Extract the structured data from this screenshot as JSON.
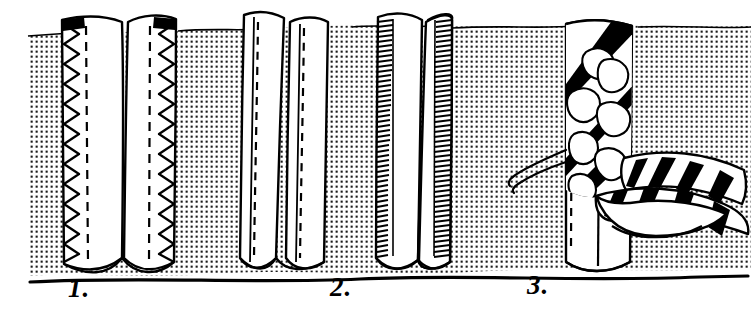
{
  "figure": {
    "medium": "pen-and-ink line drawing with halftone dot shading",
    "width": 751,
    "height": 311,
    "background_color": "#ffffff",
    "ink_color": "#000000",
    "fabric_tone": "#d9d9d9"
  },
  "labels": [
    {
      "id": "1",
      "text": "1.",
      "x": 68,
      "y": 275
    },
    {
      "id": "2",
      "text": "2.",
      "x": 330,
      "y": 274
    },
    {
      "id": "3",
      "text": "3.",
      "x": 527,
      "y": 272
    }
  ],
  "panels": [
    {
      "number": "1.",
      "name": "zigzag-overcast-finish",
      "caption": "Zigzag / overcast stitched raw edges",
      "stitch_type": "zigzag",
      "stitch_detail": "Open zigzag overcasting worked over each raw edge, with a dashed machine seam line stitched just inside the edge.",
      "seam_allowances": 2,
      "x_range": [
        60,
        178
      ]
    },
    {
      "number": "2.",
      "name": "turned-and-stitched-and-dense-overcast",
      "caption": "Turned-and-stitched edges and closely overcast edges",
      "stitch_type": "running-stitch-and-dense-overcast",
      "stitch_detail": "Left pair: raw edges turned under and secured with a dashed line of straight topstitching. Right pair: edges finished with dense close-worked overcast (serged) stitches.",
      "seam_allowances": 4,
      "x_range": [
        238,
        452
      ]
    },
    {
      "number": "3.",
      "name": "bias-tape-bound-finish",
      "caption": "Raw edges bound with printed bias tape",
      "stitch_type": "bias-binding",
      "stitch_detail": "A printed bias tape is folded over the raw edge and stitched with a dashed line; the free tail of the tape trails away to the right. Two loose thread tails curl out at the left.",
      "seam_allowances": 2,
      "tape_pattern": "floral print with bold diagonal black stripes",
      "x_range": [
        560,
        751
      ]
    }
  ],
  "annotations": {
    "baseline": "heavy black rule along the lower edge of the fabric",
    "fabric_edge": "wavy hand-drawn contour top and bottom",
    "thread_tails": 2
  }
}
